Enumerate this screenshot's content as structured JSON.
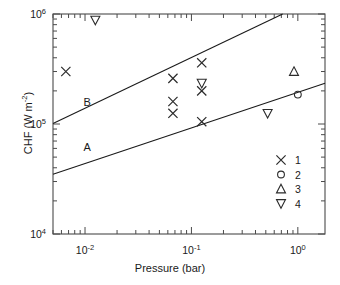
{
  "chart_data": {
    "type": "scatter",
    "title": "",
    "xlabel": "Pressure (bar)",
    "ylabel": "CHF (W m-2)",
    "ylabel_base": "CHF (W m",
    "ylabel_exp": "-2",
    "ylabel_tail": ")",
    "xscale": "log",
    "yscale": "log",
    "xlim": [
      0.005,
      1.8
    ],
    "ylim": [
      10000,
      1000000
    ],
    "grid": false,
    "legend_position": "bottom-right",
    "xticks": [
      {
        "value": 0.01,
        "label": "10",
        "exp": "-2"
      },
      {
        "value": 0.1,
        "label": "10",
        "exp": "-1"
      },
      {
        "value": 1.0,
        "label": "10",
        "exp": "0"
      }
    ],
    "yticks": [
      {
        "value": 1000000,
        "label": "10",
        "exp": "6"
      },
      {
        "value": 100000,
        "label": "10",
        "exp": "5"
      },
      {
        "value": 10000,
        "label": "10",
        "exp": "4"
      }
    ],
    "series": [
      {
        "name": "1",
        "marker": "x",
        "points": [
          {
            "x": 0.0066,
            "y": 300000
          },
          {
            "x": 0.067,
            "y": 260000
          },
          {
            "x": 0.067,
            "y": 160000
          },
          {
            "x": 0.067,
            "y": 125000
          },
          {
            "x": 0.125,
            "y": 360000
          },
          {
            "x": 0.125,
            "y": 200000
          },
          {
            "x": 0.125,
            "y": 105000
          }
        ]
      },
      {
        "name": "2",
        "marker": "circle",
        "points": [
          {
            "x": 1.0,
            "y": 185000
          }
        ]
      },
      {
        "name": "3",
        "marker": "triangle-up",
        "points": [
          {
            "x": 0.92,
            "y": 300000
          }
        ]
      },
      {
        "name": "4",
        "marker": "triangle-down",
        "points": [
          {
            "x": 0.0125,
            "y": 880000
          },
          {
            "x": 0.125,
            "y": 235000
          },
          {
            "x": 0.52,
            "y": 125000
          }
        ]
      }
    ],
    "trend_lines": [
      {
        "name": "A",
        "label": "A",
        "x_start": 0.005,
        "y_start": 35000,
        "x_end": 1.8,
        "y_end": 235000,
        "label_x": 0.0105,
        "label_y": 57000
      },
      {
        "name": "B",
        "label": "B",
        "x_start": 0.005,
        "y_start": 101000,
        "x_end": 0.72,
        "y_end": 1000000,
        "label_x": 0.0105,
        "label_y": 145000
      }
    ],
    "legend_entries": [
      {
        "marker": "x",
        "label": "1"
      },
      {
        "marker": "circle",
        "label": "2"
      },
      {
        "marker": "triangle-up",
        "label": "3"
      },
      {
        "marker": "triangle-down",
        "label": "4"
      }
    ]
  }
}
